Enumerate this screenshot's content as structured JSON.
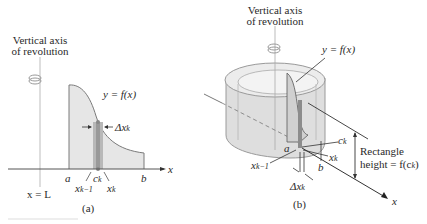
{
  "panel_a": {
    "axis_title_line1": "Vertical axis",
    "axis_title_line2": "of revolution",
    "curve_label": "y = f(x)",
    "delta_label": "Δx",
    "delta_sub": "k",
    "a_label": "a",
    "b_label": "b",
    "ck_label": "c",
    "ck_sub": "k",
    "xk1_label": "x",
    "xk1_sub": "k−1",
    "xk_label": "x",
    "xk_sub": "k",
    "x_axis_label": "x",
    "line_label": "x = L",
    "caption": "(a)"
  },
  "panel_b": {
    "axis_title_line1": "Vertical axis",
    "axis_title_line2": "of revolution",
    "curve_label": "y = f(x)",
    "ck_label": "c",
    "ck_sub": "k",
    "a_label": "a",
    "b_label": "b",
    "xk_label": "x",
    "xk_sub": "k",
    "xk1_label": "x",
    "xk1_sub": "k−1",
    "delta_label": "Δx",
    "delta_sub": "k",
    "rect_line1": "Rectangle",
    "rect_line2": "height = f(c",
    "rect_sub": "k",
    "rect_close": ")",
    "x_axis_label": "x",
    "caption": "(b)"
  },
  "colors": {
    "region_fill": "#e4e4e4",
    "strip_fill": "#a9a9a9",
    "cylinder_fill": "#dcdcdc",
    "line": "#555555"
  }
}
